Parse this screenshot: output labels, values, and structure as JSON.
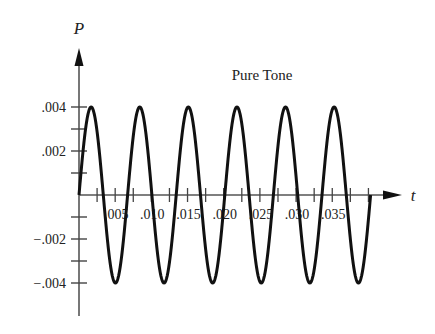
{
  "chart_data": {
    "type": "line",
    "title": "Pure Tone",
    "xlabel": "t",
    "ylabel": "P",
    "series": [
      {
        "name": "Pure Tone",
        "function": "P = 0.004 * sin(2*pi*f*t)",
        "amplitude": 0.004,
        "frequency_hz": 150,
        "cycles": 6,
        "t_start": 0,
        "t_end": 0.04
      }
    ],
    "x_tick_labels": [
      ".005",
      ".010",
      ".015",
      ".020",
      ".025",
      ".030",
      ".035"
    ],
    "x_ticks": [
      0.005,
      0.01,
      0.015,
      0.02,
      0.025,
      0.03,
      0.035
    ],
    "y_tick_labels": [
      ".004",
      ".002",
      "−.002",
      "−.004"
    ],
    "y_ticks": [
      0.004,
      0.002,
      -0.002,
      -0.004
    ],
    "xlim": [
      0,
      0.045
    ],
    "ylim": [
      -0.005,
      0.0055
    ],
    "grid": false,
    "legend": "none"
  }
}
